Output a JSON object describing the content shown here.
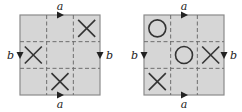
{
  "colors": {
    "board_fill": "#d6d6d6",
    "border": "#8a8a8a",
    "grid_dash": "#6e6e6e",
    "mark": "#333333",
    "arrow": "#222222"
  },
  "boards": [
    {
      "name": "left-board",
      "edge_labels": {
        "top": "a",
        "bottom": "a",
        "left": "b",
        "right": "b"
      },
      "grid": [
        [
          "",
          "",
          "X"
        ],
        [
          "X",
          "",
          ""
        ],
        [
          "",
          "X",
          ""
        ]
      ]
    },
    {
      "name": "right-board",
      "edge_labels": {
        "top": "a",
        "bottom": "a",
        "left": "b",
        "right": "b"
      },
      "grid": [
        [
          "O",
          "",
          ""
        ],
        [
          "",
          "O",
          "X"
        ],
        [
          "X",
          "",
          ""
        ]
      ]
    }
  ]
}
